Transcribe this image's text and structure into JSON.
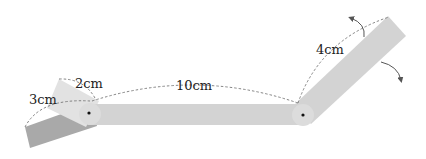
{
  "diagram": {
    "labels": {
      "left_short": "3cm",
      "left_top": "2cm",
      "middle": "10cm",
      "right": "4cm"
    },
    "colors": {
      "bar_fill": "#d3d3d3",
      "bar_dark": "#a9a9a9",
      "bar_light": "#e2e2e2",
      "dashed_line": "#777777",
      "pivot": "#111111"
    },
    "arrows": [
      {
        "name": "rotation-arrow-up",
        "direction": "counterclockwise"
      },
      {
        "name": "rotation-arrow-down",
        "direction": "clockwise"
      }
    ]
  }
}
